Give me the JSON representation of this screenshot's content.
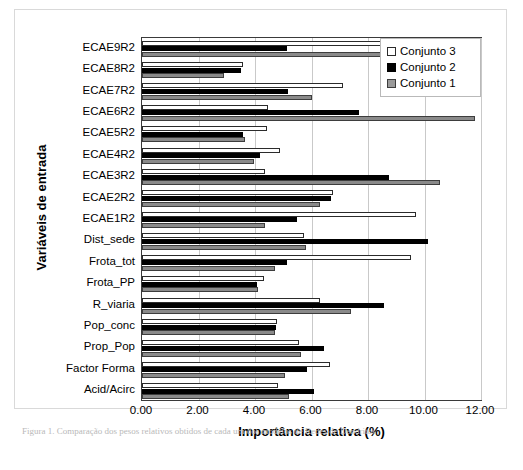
{
  "figure": {
    "caption": "Figura 1. Comparação dos pesos relativos obtidos de cada um dos modelos de Redes de Dendritos"
  },
  "chart_data": {
    "type": "bar",
    "orientation": "horizontal",
    "title": "",
    "xlabel": "Importância relativa (%)",
    "ylabel": "Variáveis de entrada",
    "xlim": [
      0,
      12
    ],
    "xticks": [
      "0.00",
      "2.00",
      "4.00",
      "6.00",
      "8.00",
      "10.00",
      "12.00"
    ],
    "xtick_values": [
      0,
      2,
      4,
      6,
      8,
      10,
      12
    ],
    "grid": "vertical",
    "legend_position": "top-right",
    "categories": [
      "ECAE9R2",
      "ECAE8R2",
      "ECAE7R2",
      "ECAE6R2",
      "ECAE5R2",
      "ECAE4R2",
      "ECAE3R2",
      "ECAE2R2",
      "ECAE1R2",
      "Dist_sede",
      "Frota_tot",
      "Frota_PP",
      "R_viaria",
      "Pop_conc",
      "Prop_Pop",
      "Factor Forma",
      "Acid/Acirc"
    ],
    "series": [
      {
        "name": "Conjunto 3",
        "color": "#ffffff",
        "edge": "#2b2b2b",
        "values": [
          8.45,
          3.58,
          7.12,
          4.45,
          4.44,
          4.9,
          4.37,
          6.77,
          9.71,
          5.74,
          9.51,
          4.33,
          6.3,
          4.78,
          5.54,
          6.65,
          4.83
        ]
      },
      {
        "name": "Conjunto 2",
        "color": "#000000",
        "edge": "#000000",
        "values": [
          5.13,
          3.52,
          5.16,
          7.68,
          3.58,
          4.17,
          8.74,
          6.69,
          5.48,
          10.14,
          5.13,
          4.08,
          8.55,
          4.75,
          6.45,
          5.83,
          6.08
        ]
      },
      {
        "name": "Conjunto 1",
        "color": "#8a8a8a",
        "edge": "#3d3d3d",
        "values": [
          8.69,
          2.89,
          6.01,
          11.77,
          3.64,
          3.96,
          10.56,
          6.3,
          4.34,
          5.81,
          4.72,
          4.11,
          7.39,
          4.72,
          5.63,
          5.07,
          5.2
        ]
      }
    ],
    "legend": [
      {
        "label": "Conjunto 3",
        "swatch": "sw3"
      },
      {
        "label": "Conjunto 2",
        "swatch": "sw2"
      },
      {
        "label": "Conjunto 1",
        "swatch": "sw1"
      }
    ]
  }
}
